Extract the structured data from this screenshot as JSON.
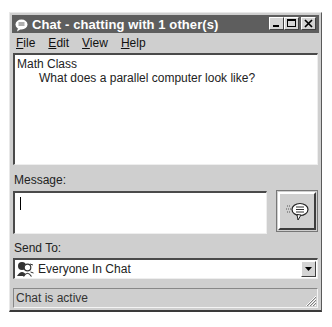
{
  "window": {
    "title": "Chat - chatting with 1 other(s)",
    "icon": "chat-bubble-icon",
    "controls": {
      "minimize": "minimize-icon",
      "maximize": "maximize-icon",
      "close": "close-icon"
    }
  },
  "menu": {
    "items": [
      {
        "accel": "F",
        "rest": "ile"
      },
      {
        "accel": "E",
        "rest": "dit"
      },
      {
        "accel": "V",
        "rest": "iew"
      },
      {
        "accel": "H",
        "rest": "elp"
      }
    ]
  },
  "chat_log": {
    "room": "Math Class",
    "messages": [
      "What does a parallel computer look like?"
    ]
  },
  "message": {
    "label": "Message:",
    "value": "",
    "send_icon": "send-speech-bubble-icon"
  },
  "send_to": {
    "label": "Send To:",
    "selected": "Everyone In Chat",
    "icon": "group-people-icon"
  },
  "status": {
    "text": "Chat is active"
  },
  "colors": {
    "titlebar": "#5e5e5e",
    "window_face": "#cfcfcf",
    "field_bg": "#ffffff"
  }
}
